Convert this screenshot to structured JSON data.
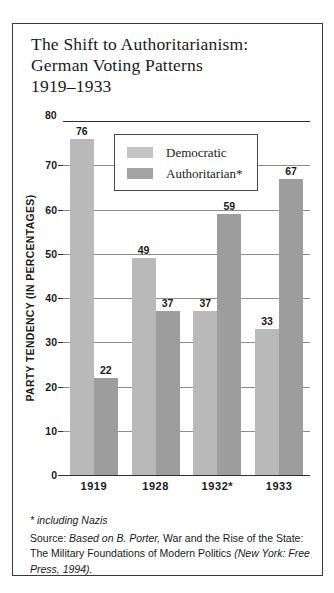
{
  "figure": {
    "title_lines": [
      "The Shift to Authoritarianism:",
      "German Voting Patterns",
      "1919–1933"
    ],
    "footnote": "* including Nazis",
    "source": {
      "label": "Source: ",
      "italic_1": "Based on B. Porter,",
      "roman_1": " War and the Rise of the State: The Military Foundations of Modern Politics ",
      "italic_2": "(New York: Free Press, 1994)."
    }
  },
  "colors": {
    "democratic": "#b9b9b9",
    "authoritarian": "#9d9d9d",
    "legend_democratic": "#c4c4c4",
    "legend_authoritarian": "#a4a4a4",
    "gridline": "#8d8d8d",
    "axis": "#2f2f2f",
    "border": "#3a3a3a",
    "text": "#1a1a1a"
  },
  "chart_data": {
    "type": "bar",
    "title": "The Shift to Authoritarianism: German Voting Patterns 1919–1933",
    "xlabel": "",
    "ylabel": "PARTY TENDENCY (IN PERCENTAGES)",
    "ylim": [
      0,
      80
    ],
    "yticks": [
      0,
      10,
      20,
      30,
      40,
      50,
      60,
      70,
      80
    ],
    "ytick_labels": [
      "0",
      "10",
      "20",
      "30",
      "40",
      "50",
      "60",
      "70",
      "80"
    ],
    "grid": true,
    "legend_position": "top-center",
    "categories": [
      "1919",
      "1928",
      "1932*",
      "1933"
    ],
    "series": [
      {
        "name": "Democratic",
        "values": [
          76,
          49,
          37,
          33
        ]
      },
      {
        "name": "Authoritarian*",
        "values": [
          22,
          37,
          59,
          67
        ]
      }
    ]
  }
}
